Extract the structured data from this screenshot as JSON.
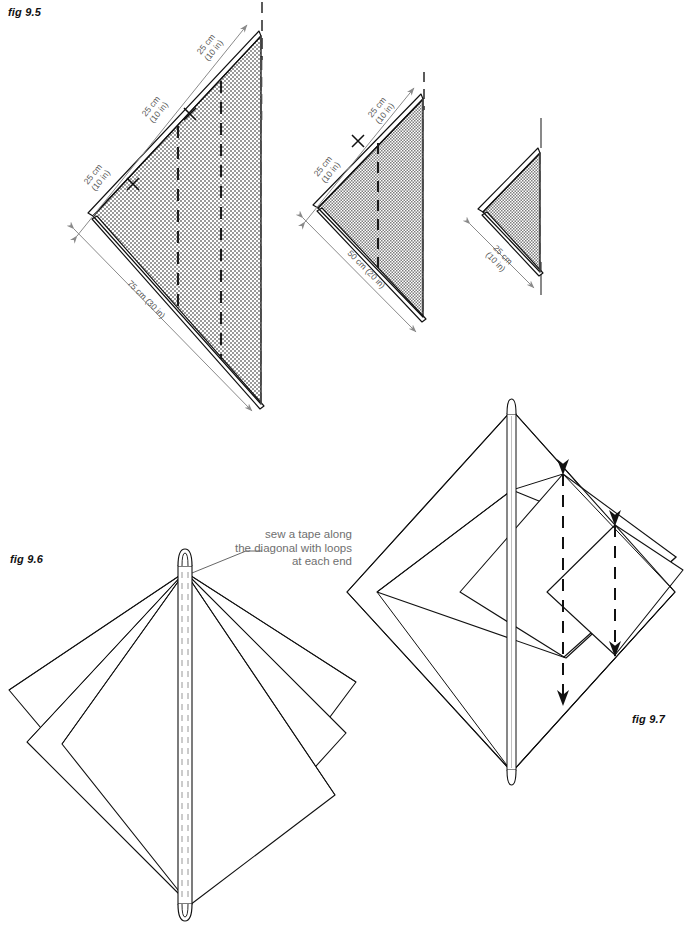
{
  "figures": [
    {
      "id": "fig-9-5",
      "label": "fig 9.5",
      "caption": "",
      "panels": [
        {
          "name": "large-triangle",
          "dimensions": [
            {
              "text": "25 cm\n(10 in)",
              "line1": "25 cm",
              "line2": "(10 in)"
            },
            {
              "text": "25 cm\n(10 in)",
              "line1": "25 cm",
              "line2": "(10 in)"
            },
            {
              "text": "25 cm\n(10 in)",
              "line1": "25 cm",
              "line2": "(10 in)"
            },
            {
              "text": "75 cm (30 in)",
              "line1": "75 cm (30 in)",
              "line2": ""
            }
          ],
          "tick_marks": 2,
          "fold_lines": 2
        },
        {
          "name": "medium-triangle",
          "dimensions": [
            {
              "text": "25 cm\n(10 in)",
              "line1": "25 cm",
              "line2": "(10 in)"
            },
            {
              "text": "25 cm\n(10 in)",
              "line1": "25 cm",
              "line2": "(10 in)"
            },
            {
              "text": "50 cm (20 in)",
              "line1": "50 cm (20 in)",
              "line2": ""
            }
          ],
          "tick_marks": 1,
          "fold_lines": 1
        },
        {
          "name": "small-triangle",
          "dimensions": [
            {
              "text": "25 cm\n(10 in)",
              "line1": "25 cm",
              "line2": "(10 in)"
            }
          ],
          "tick_marks": 0,
          "fold_lines": 0
        }
      ]
    },
    {
      "id": "fig-9-6",
      "label": "fig 9.6",
      "caption": "sew a tape along\nthe diagonal with loops\nat each end",
      "caption_lines": [
        "sew a tape along",
        "the diagonal with loops",
        "at each end"
      ],
      "layers": 3,
      "loops": 2
    },
    {
      "id": "fig-9-7",
      "label": "fig 9.7",
      "caption": "",
      "layers": 3,
      "loops": 2,
      "fold_lines": 2
    }
  ],
  "colors": {
    "ink": "#111111",
    "note_text": "#6f6f6f",
    "dimension_line": "#8a8a8a",
    "fabric_fill": "#bdbdbd",
    "background": "#ffffff"
  }
}
